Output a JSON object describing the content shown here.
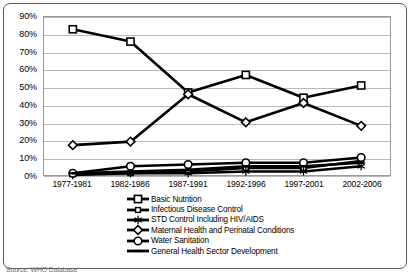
{
  "chart_data": {
    "type": "line",
    "title": "",
    "subtitle": "",
    "xlabel": "",
    "ylabel": "",
    "ylim": [
      0,
      90
    ],
    "ytick_labels": [
      "0%",
      "10%",
      "20%",
      "30%",
      "40%",
      "50%",
      "60%",
      "70%",
      "80%",
      "90%"
    ],
    "ytick_values": [
      0,
      10,
      20,
      30,
      40,
      50,
      60,
      70,
      80,
      90
    ],
    "grid": true,
    "legend_position": "bottom",
    "categories": [
      "1977-1981",
      "1982-1986",
      "1987-1991",
      "1992-1996",
      "1997-2001",
      "2002-2006"
    ],
    "series": [
      {
        "name": "Basic Nutrition",
        "marker": "square-hollow",
        "color": "#000000",
        "values": [
          83,
          76,
          47,
          57,
          44,
          51
        ]
      },
      {
        "name": "Infectious Disease Control",
        "marker": "square-hollow-small",
        "color": "#000000",
        "values": [
          1,
          1,
          2,
          4,
          4,
          8
        ]
      },
      {
        "name": "STD Control Including HIV/AIDS",
        "marker": "asterisk",
        "color": "#000000",
        "values": [
          0,
          1,
          1,
          2,
          2,
          5
        ]
      },
      {
        "name": "Maternal Health and Perinatal Conditions",
        "marker": "diamond-hollow",
        "color": "#000000",
        "values": [
          17,
          19,
          46,
          30,
          41,
          28
        ]
      },
      {
        "name": "Water Sanitation",
        "marker": "circle-hollow",
        "color": "#000000",
        "values": [
          1,
          5,
          6,
          7,
          7,
          10
        ]
      },
      {
        "name": "General Health Sector Development",
        "marker": "dash",
        "color": "#000000",
        "values": [
          1,
          2,
          3,
          5,
          5,
          7
        ]
      }
    ]
  },
  "source_note": "Source: WHO Database",
  "icons": {
    "legend_marker_square": "square-hollow-icon",
    "legend_marker_diamond": "diamond-hollow-icon",
    "legend_marker_circle": "circle-hollow-icon",
    "legend_marker_asterisk": "asterisk-icon",
    "legend_marker_dash": "dash-icon"
  }
}
